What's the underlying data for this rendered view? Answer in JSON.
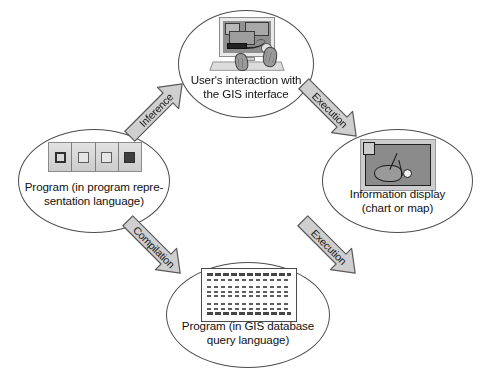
{
  "diagram": {
    "canvas": {
      "width": 490,
      "height": 378,
      "background": "#ffffff"
    },
    "style": {
      "node_outline": "#4d4d4d",
      "arrow_fill": "#cfcfcf",
      "arrow_outline": "#5a5a5a",
      "text": "#111111"
    },
    "nodes": [
      {
        "id": "user",
        "label": "User's interaction with\nthe GIS interface",
        "icon": "computer-with-hands-icon"
      },
      {
        "id": "program_representation",
        "label": "Program (in program repre-\nsentation language)",
        "icon": "four-cell-program-icon"
      },
      {
        "id": "information_display",
        "label": "Information display\n(chart or map)",
        "icon": "map-chart-display-icon"
      },
      {
        "id": "program_gis",
        "label": "Program (in GIS database\nquery language)",
        "icon": "code-listing-icon"
      }
    ],
    "arrows": [
      {
        "id": "inference",
        "label": "Inference",
        "from": "user",
        "to": "program_representation",
        "direction": "down-left"
      },
      {
        "id": "execution_1",
        "label": "Execution",
        "from": "user",
        "to": "information_display",
        "direction": "down-right"
      },
      {
        "id": "compilation",
        "label": "Compilation",
        "from": "program_representation",
        "to": "program_gis",
        "direction": "down-right"
      },
      {
        "id": "execution_2",
        "label": "Execution",
        "from": "program_gis",
        "to": "information_display",
        "direction": "up-right"
      }
    ]
  }
}
